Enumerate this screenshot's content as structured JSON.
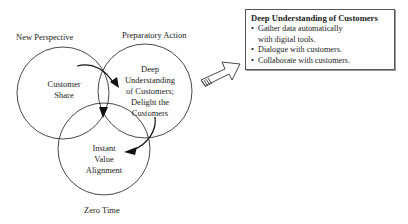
{
  "diagram": {
    "circles": [
      {
        "id": "new-perspective",
        "label": "New Perspective",
        "content": [
          "Customer",
          "Share"
        ]
      },
      {
        "id": "preparatory-action",
        "label": "Preparatory Action",
        "content": [
          "Deep",
          "Understanding",
          "of Customers;",
          "Delight the",
          "Customers"
        ]
      },
      {
        "id": "zero-time",
        "label": "Zero Time",
        "content": [
          "Instant",
          "Value",
          "Alignment"
        ]
      }
    ],
    "callout": {
      "title": "Deep Understanding of Customers",
      "bullets": [
        "Gather data automatically with digital tools.",
        "Dialogue with customers.",
        "Collaborate with customers."
      ]
    }
  }
}
